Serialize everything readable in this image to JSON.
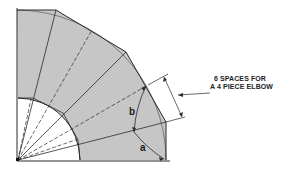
{
  "diagram": {
    "callout": {
      "line1": "6 SPACES FOR",
      "line2": "A 4 PIECE ELBOW"
    },
    "labels": {
      "b": "b",
      "a": "a"
    },
    "colors": {
      "fill": "#c6c6c6",
      "stroke": "#2a2a2a",
      "background": "#ffffff"
    },
    "geometry": {
      "origin": [
        18,
        160
      ],
      "outer_radius": 150,
      "inner_radius": 62,
      "pieces": 4,
      "spaces": 6
    }
  }
}
